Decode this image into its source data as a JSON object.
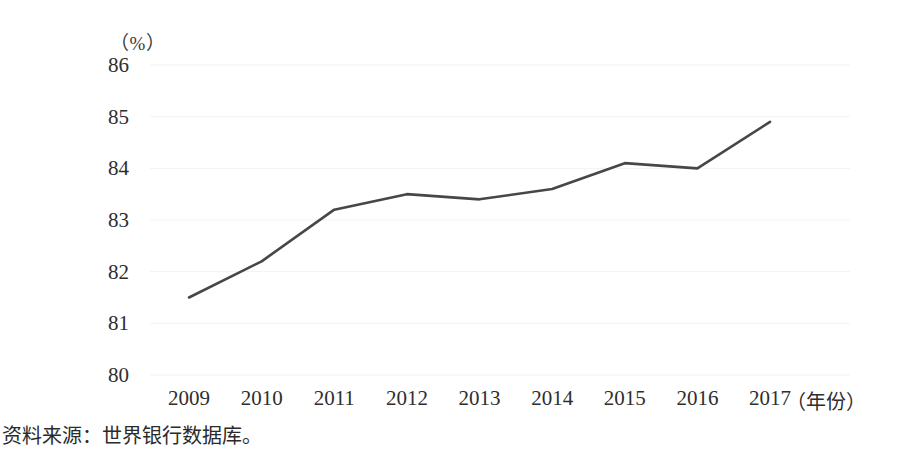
{
  "chart_data": {
    "type": "line",
    "title": "",
    "subtitle": "",
    "xlabel": "（年份）",
    "ylabel": "（%）",
    "categories": [
      "2009",
      "2010",
      "2011",
      "2012",
      "2013",
      "2014",
      "2015",
      "2016",
      "2017"
    ],
    "x": [
      2009,
      2010,
      2011,
      2012,
      2013,
      2014,
      2015,
      2016,
      2017
    ],
    "values": [
      81.5,
      82.2,
      83.2,
      83.5,
      83.4,
      83.6,
      84.1,
      84.0,
      84.9
    ],
    "series": [
      {
        "name": "",
        "values": [
          81.5,
          82.2,
          83.2,
          83.5,
          83.4,
          83.6,
          84.1,
          84.0,
          84.9
        ]
      }
    ],
    "ylim": [
      80,
      86
    ],
    "yticks": [
      80,
      81,
      82,
      83,
      84,
      85,
      86
    ],
    "ytick_labels": [
      "80",
      "81",
      "82",
      "83",
      "84",
      "85",
      "86"
    ],
    "xlim": [
      2009,
      2017
    ],
    "grid": false,
    "legend": "none",
    "line_color": "#474747",
    "markers": false
  },
  "axis": {
    "y_unit_label": "（%）",
    "x_axis_title": "（年份）"
  },
  "caption": {
    "source_note": "资料来源：世界银行数据库。"
  }
}
